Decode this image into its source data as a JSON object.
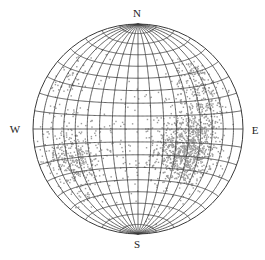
{
  "diagram": {
    "type": "equal-area stereonet (Schmidt net), equatorial",
    "grid_interval_deg": 10,
    "center": [
      138,
      129
    ],
    "radius": 105,
    "colors": {
      "grid": "#3a3a3a",
      "points": "#9a9a9a",
      "background": "#ffffff",
      "labels": "#222222"
    },
    "labels": {
      "north": "N",
      "south": "S",
      "west": "W",
      "east": "E"
    },
    "label_positions": {
      "north": [
        137,
        13
      ],
      "south": [
        137,
        244
      ],
      "west": [
        15,
        129
      ],
      "east": [
        255,
        130
      ]
    },
    "point_clusters": [
      {
        "name": "east-dense",
        "lon": 40,
        "lat": -15,
        "spread_lon": 22,
        "spread_lat": 22,
        "count": 900
      },
      {
        "name": "east-upper",
        "lon": 55,
        "lat": 25,
        "spread_lon": 20,
        "spread_lat": 22,
        "count": 260
      },
      {
        "name": "west-lower",
        "lon": -55,
        "lat": -20,
        "spread_lon": 22,
        "spread_lat": 22,
        "count": 380
      },
      {
        "name": "west-upper",
        "lon": -65,
        "lat": 30,
        "spread_lon": 15,
        "spread_lat": 20,
        "count": 60
      },
      {
        "name": "scatter",
        "lon": 0,
        "lat": -10,
        "spread_lon": 60,
        "spread_lat": 45,
        "count": 160
      }
    ]
  }
}
